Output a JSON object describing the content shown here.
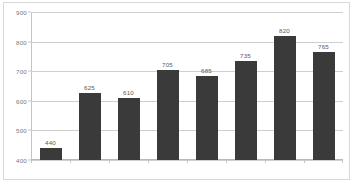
{
  "chart_data": {
    "type": "bar",
    "title": "",
    "subtitle": "",
    "xlabel": "",
    "ylabel": "",
    "categories": [
      "",
      "",
      "",
      "",
      "",
      "",
      "",
      ""
    ],
    "values": [
      440,
      625,
      610,
      705,
      685,
      735,
      820,
      765
    ],
    "data_labels": [
      "440",
      "625",
      "610",
      "705",
      "685",
      "735",
      "820",
      "765"
    ],
    "ylim": [
      400,
      900
    ],
    "yticks": [
      400,
      500,
      600,
      700,
      800,
      900
    ],
    "ytick_labels": [
      "400",
      "500",
      "600",
      "700",
      "800",
      "900"
    ],
    "grid": true,
    "legend": "none",
    "series": [
      {
        "name": "",
        "values": [
          440,
          625,
          610,
          705,
          685,
          735,
          820,
          765
        ]
      }
    ],
    "colors": {
      "bar": "#3a3a3a",
      "gridline": "#cfcfcf",
      "axis": "#c4c4c4",
      "border": "#d8d8d8",
      "label_text": "#595959",
      "tick_text": "#777777",
      "background": "#ffffff"
    }
  }
}
